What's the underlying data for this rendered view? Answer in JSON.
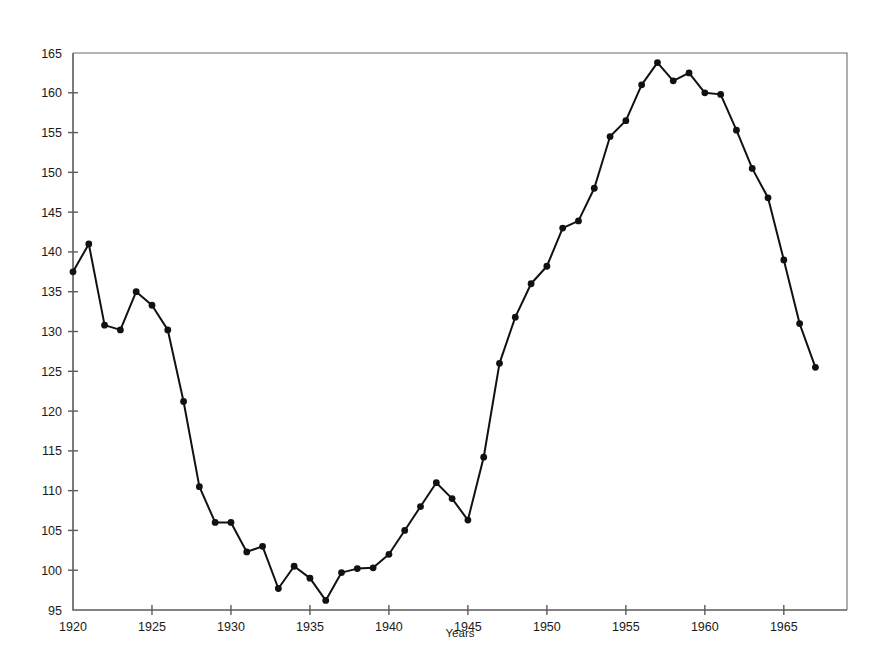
{
  "chart_data": {
    "type": "line",
    "title": "",
    "subtitle": "",
    "xlabel": "Years",
    "ylabel": "",
    "xlim": [
      1920,
      1969
    ],
    "ylim": [
      95,
      165
    ],
    "grid": false,
    "legend": "none",
    "x_ticks": [
      1920,
      1925,
      1930,
      1935,
      1940,
      1945,
      1950,
      1955,
      1960,
      1965
    ],
    "x_tick_labels": [
      "1920",
      "1925",
      "1930",
      "1935",
      "1940",
      "1945",
      "1950",
      "1955",
      "1960",
      "1965"
    ],
    "y_ticks": [
      95,
      100,
      105,
      110,
      115,
      120,
      125,
      130,
      135,
      140,
      145,
      150,
      155,
      160,
      165
    ],
    "y_tick_labels": [
      "95",
      "100",
      "105",
      "110",
      "115",
      "120",
      "125",
      "130",
      "135",
      "140",
      "145",
      "150",
      "155",
      "160",
      "165"
    ],
    "x": [
      1920,
      1921,
      1922,
      1923,
      1924,
      1925,
      1926,
      1927,
      1928,
      1929,
      1930,
      1931,
      1932,
      1933,
      1934,
      1935,
      1936,
      1937,
      1938,
      1939,
      1940,
      1941,
      1942,
      1943,
      1944,
      1945,
      1946,
      1947,
      1948,
      1949,
      1950,
      1951,
      1952,
      1953,
      1954,
      1955,
      1956,
      1957,
      1958,
      1959,
      1960,
      1961,
      1962,
      1963,
      1964,
      1965,
      1966,
      1967
    ],
    "values": [
      137.5,
      141.0,
      130.8,
      130.2,
      135.0,
      133.3,
      130.2,
      121.2,
      110.5,
      106.0,
      106.0,
      102.3,
      103.0,
      97.7,
      100.5,
      99.0,
      96.2,
      99.7,
      100.2,
      100.3,
      102.0,
      105.0,
      108.0,
      111.0,
      109.0,
      106.3,
      114.2,
      126.0,
      131.8,
      136.0,
      138.2,
      143.0,
      143.9,
      148.0,
      154.5,
      156.5,
      161.0,
      163.8,
      161.5,
      162.5,
      160.0,
      159.8,
      155.3,
      150.5,
      146.8,
      139.0,
      131.0,
      125.5
    ],
    "marker": "filled-circle",
    "line_color": "#111111",
    "marker_color": "#111111",
    "series": [
      {
        "name": "series-1",
        "values": [
          137.5,
          141.0,
          130.8,
          130.2,
          135.0,
          133.3,
          130.2,
          121.2,
          110.5,
          106.0,
          106.0,
          102.3,
          103.0,
          97.7,
          100.5,
          99.0,
          96.2,
          99.7,
          100.2,
          100.3,
          102.0,
          105.0,
          108.0,
          111.0,
          109.0,
          106.3,
          114.2,
          126.0,
          131.8,
          136.0,
          138.2,
          143.0,
          143.9,
          148.0,
          154.5,
          156.5,
          161.0,
          163.8,
          161.5,
          162.5,
          160.0,
          159.8,
          155.3,
          150.5,
          146.8,
          139.0,
          131.0,
          125.5
        ]
      }
    ]
  },
  "figure": {
    "background_color": "#ffffff",
    "frame_color": "#6e6e6e",
    "axis_color": "#5b5b5b"
  }
}
